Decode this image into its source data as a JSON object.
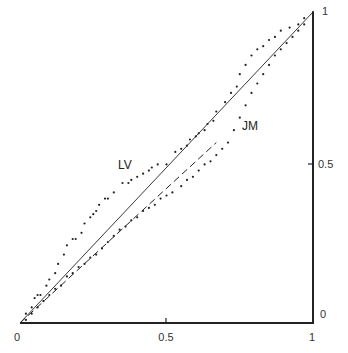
{
  "chart_data": {
    "type": "line",
    "title": "",
    "xlabel": "",
    "ylabel": "",
    "xlim": [
      0,
      1
    ],
    "ylim": [
      0,
      1
    ],
    "grid": false,
    "legend": "none",
    "x_ticks": [
      "0",
      "0.5",
      "1"
    ],
    "y_ticks": [
      "0",
      "0.5",
      "1"
    ],
    "y_axis_position": "right",
    "annotations": [
      {
        "text": "LV",
        "x": 0.38,
        "y": 0.55
      },
      {
        "text": "JM",
        "x": 0.76,
        "y": 0.68
      }
    ],
    "series": [
      {
        "name": "diagonal",
        "style": "solid",
        "x": [
          0,
          1
        ],
        "y": [
          0,
          1
        ]
      },
      {
        "name": "fitted (dashed)",
        "style": "dashed",
        "x": [
          0,
          0.67
        ],
        "y": [
          0,
          0.58
        ]
      },
      {
        "name": "LV",
        "style": "dotted",
        "x": [
          0.02,
          0.04,
          0.05,
          0.06,
          0.07,
          0.09,
          0.1,
          0.12,
          0.13,
          0.15,
          0.16,
          0.18,
          0.19,
          0.21,
          0.22,
          0.24,
          0.25,
          0.26,
          0.27,
          0.29,
          0.3,
          0.32,
          0.35,
          0.37,
          0.38,
          0.4,
          0.42,
          0.44,
          0.45,
          0.47,
          0.5,
          0.53,
          0.55,
          0.57,
          0.58,
          0.6,
          0.61,
          0.63,
          0.64,
          0.66,
          0.67,
          0.7,
          0.72,
          0.74,
          0.75,
          0.77,
          0.79,
          0.81,
          0.83,
          0.85,
          0.87,
          0.89,
          0.92,
          0.95,
          0.97,
          1.0
        ],
        "y": [
          0.03,
          0.05,
          0.08,
          0.09,
          0.09,
          0.12,
          0.14,
          0.16,
          0.19,
          0.22,
          0.25,
          0.27,
          0.27,
          0.29,
          0.32,
          0.34,
          0.35,
          0.36,
          0.38,
          0.4,
          0.4,
          0.42,
          0.45,
          0.45,
          0.46,
          0.47,
          0.48,
          0.49,
          0.5,
          0.51,
          0.51,
          0.55,
          0.56,
          0.57,
          0.59,
          0.6,
          0.61,
          0.62,
          0.64,
          0.65,
          0.68,
          0.71,
          0.74,
          0.76,
          0.8,
          0.83,
          0.86,
          0.88,
          0.89,
          0.91,
          0.92,
          0.94,
          0.95,
          0.96,
          0.98,
          1.0
        ]
      },
      {
        "name": "JM",
        "style": "dotted",
        "x": [
          0.02,
          0.04,
          0.06,
          0.08,
          0.1,
          0.12,
          0.14,
          0.16,
          0.18,
          0.2,
          0.22,
          0.24,
          0.26,
          0.28,
          0.3,
          0.32,
          0.34,
          0.36,
          0.38,
          0.4,
          0.42,
          0.44,
          0.46,
          0.48,
          0.5,
          0.52,
          0.55,
          0.57,
          0.59,
          0.61,
          0.63,
          0.65,
          0.67,
          0.69,
          0.71,
          0.73,
          0.75,
          0.77,
          0.79,
          0.81,
          0.83,
          0.85,
          0.87,
          0.89,
          0.91,
          0.93,
          0.95,
          0.97,
          1.0
        ],
        "y": [
          0.01,
          0.03,
          0.05,
          0.07,
          0.09,
          0.11,
          0.12,
          0.15,
          0.16,
          0.18,
          0.19,
          0.21,
          0.22,
          0.24,
          0.26,
          0.28,
          0.3,
          0.31,
          0.33,
          0.34,
          0.36,
          0.37,
          0.38,
          0.4,
          0.41,
          0.42,
          0.44,
          0.46,
          0.47,
          0.49,
          0.51,
          0.52,
          0.54,
          0.56,
          0.58,
          0.62,
          0.66,
          0.7,
          0.74,
          0.77,
          0.8,
          0.83,
          0.86,
          0.88,
          0.9,
          0.92,
          0.94,
          0.96,
          0.99
        ]
      }
    ]
  },
  "axes": {
    "x_tick_labels": {
      "t0": "0",
      "t05": "0.5",
      "t1": "1"
    },
    "y_tick_labels": {
      "t0": "0",
      "t05": "0.5",
      "t1": "1"
    }
  },
  "labels": {
    "lv": "LV",
    "jm": "JM"
  }
}
